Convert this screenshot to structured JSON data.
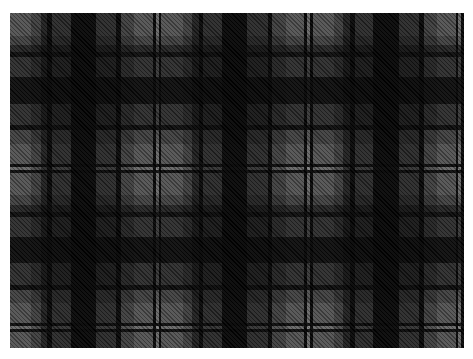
{
  "image": {
    "description": "Grey and black plaid tartan fabric pattern",
    "pattern": "tartan",
    "weave": "twill",
    "repeats_horizontal": 3,
    "repeats_vertical": 2
  },
  "palette": {
    "light_grey": "#7a7a7a",
    "mid_grey": "#5a5a5a",
    "dark_grey": "#3a3a3a",
    "charcoal": "#2b2b2b",
    "black": "#050505",
    "pale_line": "#9a9a9a"
  },
  "sett": [
    {
      "color": "light_grey",
      "threads": 23
    },
    {
      "color": "mid_grey",
      "threads": 10
    },
    {
      "color": "charcoal",
      "threads": 7
    },
    {
      "color": "black",
      "threads": 5
    },
    {
      "color": "dark_grey",
      "threads": 20
    },
    {
      "color": "black",
      "threads": 27
    },
    {
      "color": "dark_grey",
      "threads": 22
    },
    {
      "color": "black",
      "threads": 5
    },
    {
      "color": "mid_grey",
      "threads": 14
    },
    {
      "color": "light_grey",
      "threads": 20
    },
    {
      "color": "black",
      "threads": 3
    },
    {
      "color": "pale_line",
      "threads": 3
    },
    {
      "color": "black",
      "threads": 3
    }
  ]
}
